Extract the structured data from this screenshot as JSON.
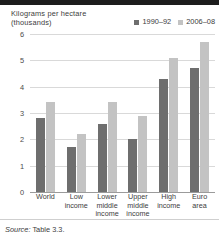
{
  "figure": {
    "axis_title_line1": "Kilograms per hectare",
    "axis_title_line2": "(thousands)",
    "source_prefix": "Source:",
    "source_text": "Table 3.3."
  },
  "colors": {
    "series_1990_92": "#6e6e6e",
    "series_2006_08": "#c3c3c3",
    "gridline": "#d9d9d9",
    "baseline": "#9b9b9b",
    "top_rule": "#1d1d1d",
    "text": "#3c3c3c"
  },
  "chart_data": {
    "type": "bar",
    "title": "Kilograms per hectare (thousands)",
    "xlabel": "",
    "ylabel": "Kilograms per hectare (thousands)",
    "ylim": [
      0,
      6
    ],
    "yticks": [
      0,
      1,
      2,
      3,
      4,
      5,
      6
    ],
    "ytick_labels": [
      "0",
      "1",
      "2",
      "3",
      "4",
      "5",
      "6"
    ],
    "grid": true,
    "legend_position": "top-right",
    "categories": [
      "World",
      "Low income",
      "Lower middle income",
      "Upper middle income",
      "High income",
      "Euro area"
    ],
    "category_label_lines": [
      [
        "World"
      ],
      [
        "Low",
        "income"
      ],
      [
        "Lower",
        "middle",
        "income"
      ],
      [
        "Upper",
        "middle",
        "income"
      ],
      [
        "High",
        "income"
      ],
      [
        "Euro",
        "area"
      ]
    ],
    "series": [
      {
        "name": "1990–92",
        "color": "#6e6e6e",
        "values": [
          2.8,
          1.7,
          2.6,
          2.0,
          4.3,
          4.7
        ]
      },
      {
        "name": "2006–08",
        "color": "#c3c3c3",
        "values": [
          3.4,
          2.2,
          3.4,
          2.9,
          5.1,
          5.7
        ]
      }
    ]
  }
}
